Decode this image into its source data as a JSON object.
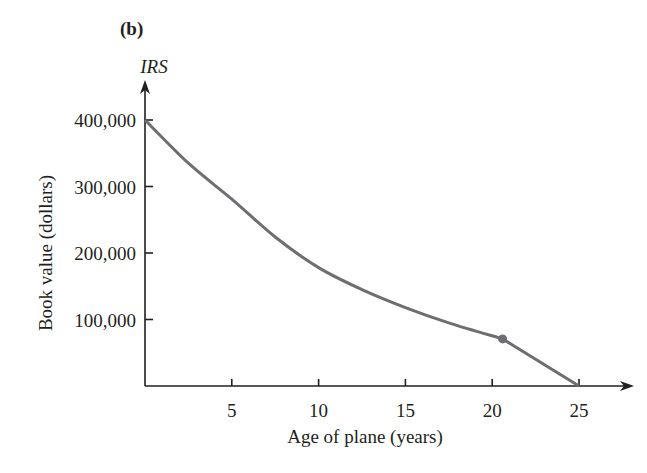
{
  "panel_label": "(b)",
  "chart_data": {
    "type": "line",
    "title": "",
    "panel": "(b)",
    "series": [
      {
        "name": "IRS",
        "x": [
          0,
          2.5,
          5,
          7.5,
          10,
          12.5,
          15,
          17.5,
          20.6,
          25
        ],
        "values": [
          400000,
          335000,
          281000,
          224000,
          178000,
          145000,
          118000,
          95000,
          70800,
          0
        ],
        "marker_at": {
          "x": 20.6,
          "y": 70800
        }
      }
    ],
    "ylabel_top": "IRS",
    "xlabel": "Age of plane (years)",
    "ylabel": "Book value (dollars)",
    "x_ticks": [
      5,
      10,
      15,
      20,
      25
    ],
    "x_tick_labels": [
      "5",
      "10",
      "15",
      "20",
      "25"
    ],
    "y_ticks": [
      100000,
      200000,
      300000,
      400000
    ],
    "y_tick_labels": [
      "100,000",
      "200,000",
      "300,000",
      "400,000"
    ],
    "xlim": [
      0,
      26.5
    ],
    "ylim": [
      0,
      440000
    ],
    "grid": false,
    "legend": "none",
    "line_color": "#6d6e71",
    "axis_color": "#231f20"
  }
}
